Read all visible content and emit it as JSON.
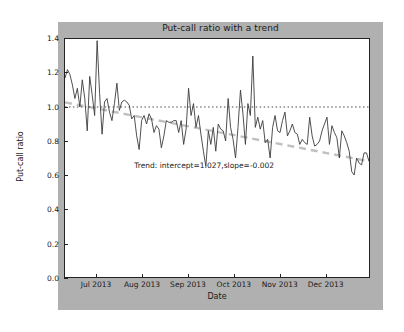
{
  "chart_data": {
    "type": "line",
    "title": "Put-call ratio with a trend",
    "xlabel": "Date",
    "ylabel": "Put-call ratio",
    "ylim": [
      0.0,
      1.4
    ],
    "yticks": [
      "0.0",
      "0.2",
      "0.4",
      "0.6",
      "0.8",
      "1.0",
      "1.2",
      "1.4"
    ],
    "ytick_values": [
      0.0,
      0.2,
      0.4,
      0.6,
      0.8,
      1.0,
      1.2,
      1.4
    ],
    "xticks": [
      "Jul 2013",
      "Aug 2013",
      "Sep 2013",
      "Oct 2013",
      "Nov 2013",
      "Dec 2013"
    ],
    "xtick_positions": [
      0.105,
      0.255,
      0.405,
      0.555,
      0.705,
      0.855
    ],
    "grid": false,
    "legend": null,
    "annotations": [
      {
        "text": "Trend: intercept=1.027,slope=-0.002",
        "x_frac": 0.455,
        "y_frac": 0.475
      }
    ],
    "series": [
      {
        "name": "Put-call ratio",
        "style": "solid",
        "color": "#3a3a3a",
        "width": 0.9,
        "values": [
          1.17,
          1.22,
          1.19,
          1.13,
          1.05,
          1.11,
          1.0,
          1.16,
          1.05,
          0.86,
          1.18,
          1.07,
          0.95,
          1.39,
          1.08,
          0.84,
          1.03,
          1.05,
          0.97,
          0.92,
          1.02,
          1.14,
          0.98,
          1.03,
          1.04,
          1.03,
          1.01,
          0.93,
          0.95,
          0.83,
          0.75,
          0.92,
          0.95,
          0.9,
          0.96,
          0.93,
          0.85,
          0.89,
          0.87,
          0.76,
          0.83,
          0.92,
          0.91,
          0.91,
          0.92,
          0.92,
          0.85,
          0.92,
          0.78,
          0.87,
          1.11,
          0.95,
          1.02,
          0.88,
          0.95,
          0.84,
          0.74,
          0.65,
          0.86,
          0.78,
          0.88,
          0.74,
          0.9,
          0.87,
          0.86,
          0.8,
          1.05,
          0.88,
          0.81,
          0.7,
          0.88,
          1.1,
          0.96,
          0.78,
          1.02,
          0.95,
          1.3,
          0.88,
          0.94,
          0.87,
          0.92,
          0.79,
          0.81,
          0.7,
          0.88,
          0.95,
          0.86,
          0.85,
          0.92,
          0.97,
          0.83,
          0.86,
          0.9,
          0.85,
          0.84,
          0.78,
          0.81,
          0.79,
          0.78,
          0.94,
          0.83,
          0.77,
          0.78,
          0.8,
          0.86,
          0.9,
          0.94,
          0.78,
          0.89,
          0.85,
          0.82,
          0.7,
          0.86,
          0.83,
          0.79,
          0.74,
          0.62,
          0.6,
          0.7,
          0.67,
          0.66,
          0.73,
          0.73,
          0.68
        ]
      },
      {
        "name": "Reference level",
        "style": "dotted",
        "color": "#333333",
        "width": 0.9,
        "constant": 1.0
      },
      {
        "name": "Trend",
        "style": "dashed",
        "color": "#c0c0c0",
        "width": 2.0,
        "intercept": 1.027,
        "slope": -0.002,
        "y_start": 1.027,
        "y_end": 0.681
      }
    ]
  },
  "figure": {
    "background_color": "#b0b0b0",
    "axes_background_color": "#ffffff",
    "axes_edge_color": "#222222"
  }
}
